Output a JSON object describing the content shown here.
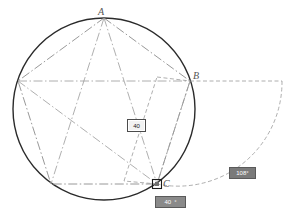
{
  "app": {
    "title": "Pentagon construction",
    "background_color": "#ffffff"
  },
  "colors": {
    "circle_stroke": "#2b2b2b",
    "pentagon_stroke": "#8c8c8c",
    "construction_stroke": "#9a9a9a",
    "marker_stroke": "#1a1a1a",
    "label_text": "#555555",
    "dim_badge_bg": "#f2f2f2",
    "angle_badge_bg": "#7a7a7a",
    "input_badge_bg": "#8a8a8a"
  },
  "geometry": {
    "circle": {
      "cx": 104,
      "cy": 109,
      "r": 91,
      "linestyle": "solid"
    },
    "pentagon": {
      "linestyle": "dash-dot",
      "vertices": [
        {
          "name": "A",
          "x": 104,
          "y": 18
        },
        {
          "name": "B",
          "x": 190,
          "y": 81
        },
        {
          "name": "C",
          "x": 157,
          "y": 184
        },
        {
          "name": "D",
          "x": 51,
          "y": 184
        },
        {
          "name": "E",
          "x": 18,
          "y": 81
        }
      ]
    },
    "construction_rect": {
      "linestyle": "dashed",
      "points": [
        {
          "x": 157,
          "y": 184
        },
        {
          "x": 124,
          "y": 180
        },
        {
          "x": 157,
          "y": 78
        },
        {
          "x": 190,
          "y": 81
        }
      ]
    },
    "arc": {
      "linestyle": "dashed",
      "from": {
        "x": 190,
        "y": 81
      },
      "to": {
        "x": 157,
        "y": 184
      },
      "radius": 104,
      "sweep": "clockwise"
    },
    "snap_marker": {
      "x": 157,
      "y": 184,
      "size": 9,
      "shape": "square"
    }
  },
  "labels": {
    "vertex_a": "A",
    "vertex_b": "B",
    "vertex_c": "C"
  },
  "badges": {
    "dimension": {
      "value": "40",
      "name": "length-dimension"
    },
    "angle": {
      "value": "108°",
      "name": "angle-dimension"
    },
    "input": {
      "value_primary": "40",
      "value_secondary": "°",
      "name": "coordinate-input"
    }
  }
}
